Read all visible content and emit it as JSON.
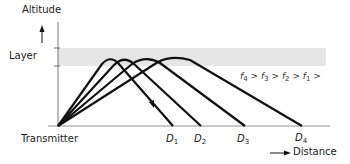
{
  "diagram": {
    "y_axis_label": "Altitude",
    "x_axis_label": "Distance",
    "layer_label": "Layer",
    "origin_label": "Transmitter",
    "layer_color": "#e6e6e6",
    "ray_color": "#111111",
    "inequality": {
      "items": [
        {
          "sym": "f",
          "sub": "4"
        },
        {
          "sym": "f",
          "sub": "3"
        },
        {
          "sym": "f",
          "sub": "2"
        },
        {
          "sym": "f",
          "sub": "1"
        }
      ],
      "separator": ">"
    },
    "distances": [
      {
        "sym": "D",
        "sub": "1",
        "x": 173
      },
      {
        "sym": "D",
        "sub": "2",
        "x": 201
      },
      {
        "sym": "D",
        "sub": "3",
        "x": 245
      },
      {
        "sym": "D",
        "sub": "4",
        "x": 302
      }
    ],
    "rays": [
      {
        "name": "f1",
        "peak_x": 110,
        "land_x": 173
      },
      {
        "name": "f2",
        "peak_x": 125,
        "land_x": 201
      },
      {
        "name": "f3",
        "peak_x": 146,
        "land_x": 245
      },
      {
        "name": "f4",
        "peak_x": 175,
        "land_x": 302
      }
    ]
  }
}
